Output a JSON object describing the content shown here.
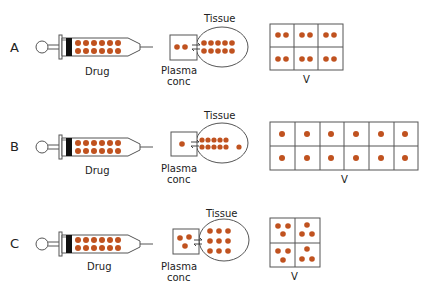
{
  "colors": {
    "drug": "#c0521f",
    "stroke": "#555555",
    "plunger": "#111111"
  },
  "rows": [
    {
      "letter": "A",
      "drug_label": "Drug",
      "plasma_label_1": "Plasma",
      "plasma_label_2": "conc",
      "tissue_label": "Tissue",
      "volume_label": "V",
      "plasma_dots": 2,
      "tissue_dots": 10,
      "volume_grid": {
        "cols": 3,
        "rows": 2,
        "dots_per_cell": 2
      }
    },
    {
      "letter": "B",
      "drug_label": "Drug",
      "plasma_label_1": "Plasma",
      "plasma_label_2": "conc",
      "tissue_label": "Tissue",
      "volume_label": "V",
      "plasma_dots": 1,
      "tissue_dots": 11,
      "volume_grid": {
        "cols": 6,
        "rows": 2,
        "dots_per_cell": 1
      }
    },
    {
      "letter": "C",
      "drug_label": "Drug",
      "plasma_label_1": "Plasma",
      "plasma_label_2": "conc",
      "tissue_label": "Tissue",
      "volume_label": "V",
      "plasma_dots": 3,
      "tissue_dots": 9,
      "volume_grid": {
        "cols": 2,
        "rows": 2,
        "dots_per_cell": 3
      }
    }
  ]
}
